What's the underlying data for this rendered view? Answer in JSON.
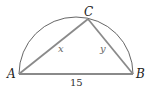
{
  "diagram": {
    "type": "triangle inscribed in semicircle",
    "points": {
      "A": "A",
      "B": "B",
      "C": "C"
    },
    "sides": {
      "AB": "15",
      "AC": "x",
      "BC": "y"
    },
    "colors": {
      "triangle": "#8a8a8a",
      "arc": "#555555"
    }
  }
}
